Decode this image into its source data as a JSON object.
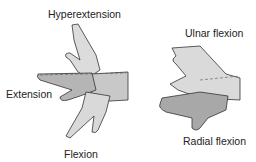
{
  "left_figure": {
    "labels": {
      "top": "Hyperextension",
      "left": "Extension",
      "bottom": "Flexion"
    }
  },
  "right_figure": {
    "labels": {
      "top": "Ulnar flexion",
      "bottom": "Radial flexion"
    }
  },
  "colors": {
    "skin_light": "#d6d6d6",
    "skin_dark": "#a9a9a9",
    "outline": "#333333"
  }
}
